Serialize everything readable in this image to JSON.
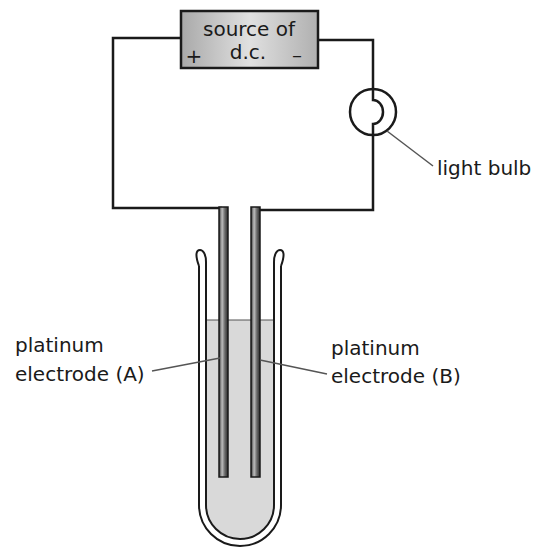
{
  "diagram": {
    "type": "electrolysis-apparatus",
    "source": {
      "line1": "source of",
      "line2": "d.c.",
      "positive_terminal": "+",
      "negative_terminal": "–"
    },
    "labels": {
      "light_bulb": "light bulb",
      "electrode_a_line1": "platinum",
      "electrode_a_line2": "electrode (A)",
      "electrode_b_line1": "platinum",
      "electrode_b_line2": "electrode (B)"
    },
    "colors": {
      "line": "#1a1a1a",
      "source_fill": "#c8c8c8",
      "liquid_fill": "#d9d9d9",
      "electrode_fill": "#6e6e6e",
      "leader_line": "#555555"
    }
  }
}
